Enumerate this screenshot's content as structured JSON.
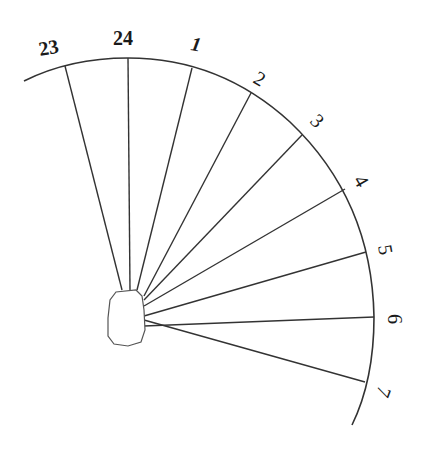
{
  "diagram": {
    "stroke_color": "#333333",
    "labels": [
      {
        "text": "23",
        "x": 40,
        "y": 56,
        "rotate": -10
      },
      {
        "text": "24",
        "x": 113,
        "y": 45,
        "rotate": 0
      },
      {
        "text": "1",
        "x": 190,
        "y": 50,
        "rotate": 10,
        "italic": true
      },
      {
        "text": "2",
        "x": 252,
        "y": 82,
        "rotate": 30
      },
      {
        "text": "3",
        "x": 309,
        "y": 122,
        "rotate": 45
      },
      {
        "text": "4",
        "x": 353,
        "y": 180,
        "rotate": 60
      },
      {
        "text": "5",
        "x": 378,
        "y": 246,
        "rotate": 80
      },
      {
        "text": "6",
        "x": 388,
        "y": 314,
        "rotate": 90
      },
      {
        "text": "7",
        "x": 379,
        "y": 385,
        "rotate": 110
      }
    ],
    "lines": [
      {
        "hour": "23",
        "x2": 65,
        "y2": 66
      },
      {
        "hour": "24",
        "x2": 128,
        "y2": 58
      },
      {
        "hour": "1",
        "x2": 192,
        "y2": 68
      },
      {
        "hour": "2",
        "x2": 251,
        "y2": 93
      },
      {
        "hour": "3",
        "x2": 302,
        "y2": 135
      },
      {
        "hour": "4",
        "x2": 345,
        "y2": 189
      },
      {
        "hour": "5",
        "x2": 366,
        "y2": 252
      },
      {
        "hour": "6",
        "x2": 374,
        "y2": 317
      },
      {
        "hour": "7",
        "x2": 365,
        "y2": 382
      }
    ]
  }
}
